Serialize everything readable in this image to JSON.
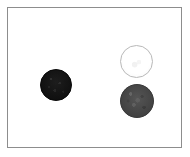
{
  "figure": {
    "title": "",
    "background_color": "#ffffff",
    "width": 190,
    "height": 157,
    "frame": {
      "name": "panel-frame",
      "border_color": "#8d8d8d",
      "border_width": 1,
      "fill_color": "#ffffff",
      "x": 7,
      "y": 7,
      "width": 175,
      "height": 141
    }
  },
  "chart_data": {
    "type": "scatter",
    "title": "",
    "xlabel": "",
    "ylabel": "",
    "grid": false,
    "legend": "none",
    "axis_ticks": "none",
    "xlim": [
      0,
      190
    ],
    "ylim": [
      0,
      157
    ],
    "marker_shape": "circle",
    "note": "Three filled circular markers of differing fill intensity on a plain white framed panel",
    "series": [
      {
        "name": "dark-marker",
        "label": "dark circle",
        "fill_color": "#151515",
        "edge_color": "#0a0a0a",
        "points": [
          {
            "x": 55,
            "y": 84,
            "diameter": 32,
            "intensity": "black"
          }
        ]
      },
      {
        "name": "light-marker",
        "label": "light circle",
        "fill_color": "#fdfdfd",
        "edge_color": "#b9b9b9",
        "points": [
          {
            "x": 135,
            "y": 60,
            "diameter": 33,
            "intensity": "white"
          }
        ]
      },
      {
        "name": "gray-marker",
        "label": "gray circle",
        "fill_color": "#4a4a4a",
        "edge_color": "#3a3a3a",
        "points": [
          {
            "x": 136,
            "y": 100,
            "diameter": 34,
            "intensity": "medium-dark-gray"
          }
        ]
      }
    ]
  }
}
